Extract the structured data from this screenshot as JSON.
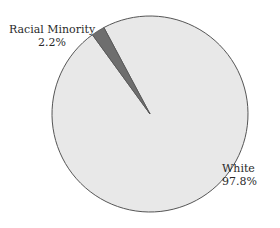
{
  "chart_data": {
    "type": "pie",
    "title": "",
    "categories": [
      "White",
      "Racial Minority"
    ],
    "values": [
      97.8,
      2.2
    ],
    "labels": [
      {
        "name": "White",
        "value_text": "97.8%"
      },
      {
        "name": "Racial Minority",
        "value_text": "2.2%"
      }
    ],
    "colors": {
      "White": "#e8e8e8",
      "Racial Minority": "#6e6e6e",
      "outline": "#555555"
    },
    "legend": "none (direct labels)"
  },
  "labels": {
    "minority_name": "Racial Minority",
    "minority_value": "2.2%",
    "white_name": "White",
    "white_value": "97.8%"
  }
}
